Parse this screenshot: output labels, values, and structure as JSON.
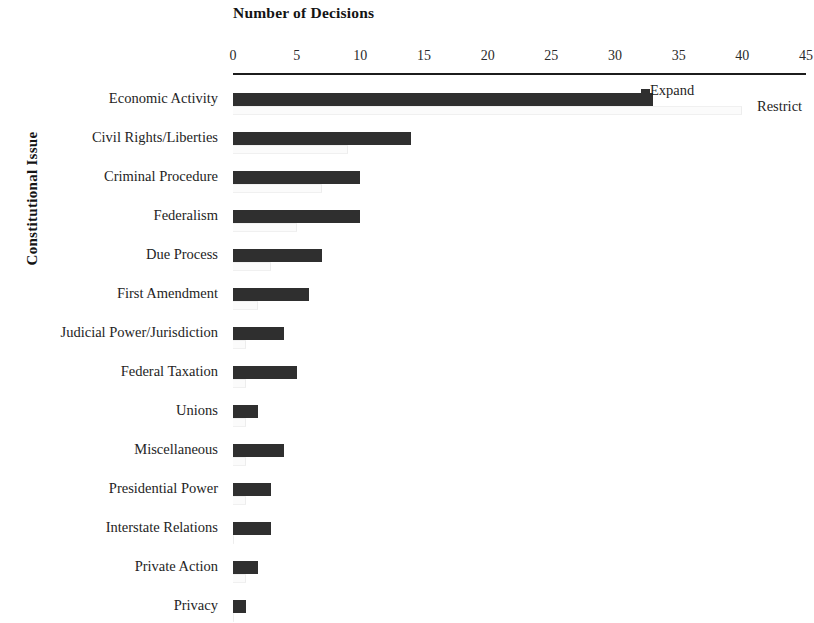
{
  "chart_data": {
    "type": "bar",
    "orientation": "horizontal",
    "title": "Number of Decisions",
    "xlabel": "Number of Decisions",
    "ylabel": "Constitutional Issue",
    "xlim": [
      0,
      45
    ],
    "xticks": [
      0,
      5,
      10,
      15,
      20,
      25,
      30,
      35,
      40,
      45
    ],
    "xtick_labels": [
      "0",
      "5",
      "10",
      "15",
      "20",
      "25",
      "30",
      "35",
      "40",
      "45"
    ],
    "grid": false,
    "legend_position": "inside-right-top",
    "categories": [
      "Economic Activity",
      "Civil Rights/Liberties",
      "Criminal Procedure",
      "Federalism",
      "Due Process",
      "First Amendment",
      "Judicial Power/Jurisdiction",
      "Federal Taxation",
      "Unions",
      "Miscellaneous",
      "Presidential Power",
      "Interstate Relations",
      "Private Action",
      "Privacy"
    ],
    "series": [
      {
        "name": "Expand",
        "color": "#2f2f2f",
        "values": [
          33,
          14,
          10,
          10,
          7,
          6,
          4,
          5,
          2,
          4,
          3,
          3,
          2,
          1
        ]
      },
      {
        "name": "Restrict",
        "color": "#fbfbfb",
        "values": [
          40,
          9,
          7,
          5,
          3,
          2,
          1,
          1,
          1,
          1,
          1,
          0,
          1,
          0
        ]
      }
    ]
  },
  "legend": {
    "expand_label": "Expand",
    "restrict_label": "Restrict"
  },
  "axes": {
    "x_title": "Number of Decisions",
    "y_title": "Constitutional Issue"
  }
}
